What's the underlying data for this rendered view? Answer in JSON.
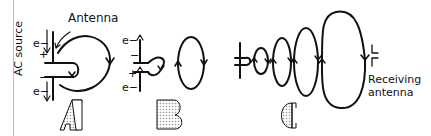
{
  "diagram": {
    "panels": [
      {
        "id": "A",
        "letter": "A",
        "labels": {
          "antenna": "Antenna",
          "source": "AC source",
          "electron_top": "e−",
          "electron_bottom": "e−",
          "plus": "+",
          "minus": "−"
        }
      },
      {
        "id": "B",
        "letter": "B",
        "labels": {
          "electron_top": "e−",
          "electron_bottom": "e−",
          "plus": "+",
          "minus": "−"
        }
      },
      {
        "id": "C",
        "letter": "C",
        "labels": {
          "receiver_line1": "Receiving",
          "receiver_line2": "antenna"
        }
      }
    ],
    "colors": {
      "ink": "#111111",
      "letter_fill": "#d8d8d8",
      "border": "#bdbdbd"
    }
  }
}
